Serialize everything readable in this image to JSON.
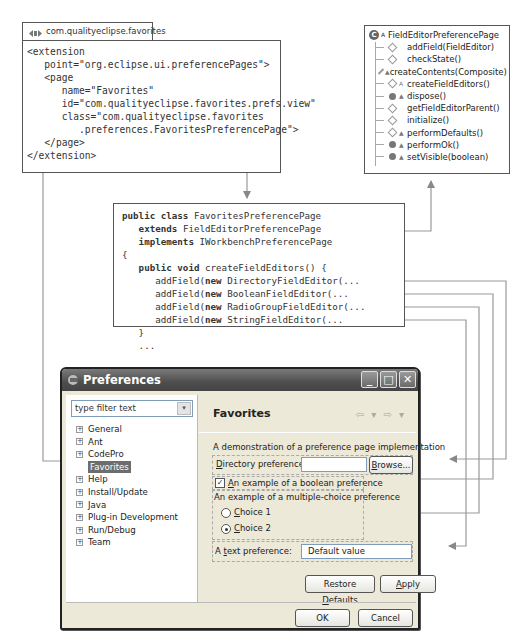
{
  "xml_panel": {
    "tab_label": "com.qualityeclipse.favorites",
    "lines": [
      "<extension",
      "   point=\"org.eclipse.ui.preferencePages\">",
      "   <page",
      "      name=\"Favorites\"",
      "      id=\"com.qualityeclipse.favorites.prefs.view\"",
      "      class=\"com.qualityeclipse.favorites",
      "         .preferences.FavoritesPreferencePage\">",
      "   </page>",
      "</extension>"
    ]
  },
  "java_panel": {
    "lines": [
      {
        "kw": "public class",
        "rest": " FavoritesPreferencePage",
        "indent": ""
      },
      {
        "kw": "extends",
        "rest": " FieldEditorPreferencePage",
        "indent": "   "
      },
      {
        "kw": "implements",
        "rest": " IWorkbenchPreferencePage",
        "indent": "   "
      },
      {
        "kw": "",
        "rest": "{",
        "indent": ""
      },
      {
        "kw": "public void",
        "rest": " createFieldEditors() {",
        "indent": "   "
      },
      {
        "kw": "new",
        "pre": "addField(",
        "rest": " DirectoryFieldEditor(...",
        "indent": "      "
      },
      {
        "kw": "new",
        "pre": "addField(",
        "rest": " BooleanFieldEditor(...",
        "indent": "      "
      },
      {
        "kw": "new",
        "pre": "addField(",
        "rest": " RadioGroupFieldEditor(...",
        "indent": "      "
      },
      {
        "kw": "new",
        "pre": "addField(",
        "rest": " StringFieldEditor(...",
        "indent": "      "
      },
      {
        "kw": "",
        "rest": "}",
        "indent": "   "
      },
      {
        "kw": "",
        "rest": "...",
        "indent": "   "
      }
    ]
  },
  "outline_panel": {
    "class_name": "FieldEditorPreferencePage",
    "class_icon": "abstract-class-icon",
    "methods": [
      {
        "name": "addField(FieldEditor)",
        "icon": "protected-method-icon",
        "decor": ""
      },
      {
        "name": "checkState()",
        "icon": "protected-method-icon",
        "decor": ""
      },
      {
        "name": "createContents(Composite)",
        "icon": "protected-method-icon",
        "decor": "▲"
      },
      {
        "name": "createFieldEditors()",
        "icon": "protected-method-icon",
        "decor": "A"
      },
      {
        "name": "dispose()",
        "icon": "public-method-icon",
        "decor": "▲"
      },
      {
        "name": "getFieldEditorParent()",
        "icon": "protected-method-icon",
        "decor": ""
      },
      {
        "name": "initialize()",
        "icon": "protected-method-icon",
        "decor": ""
      },
      {
        "name": "performDefaults()",
        "icon": "protected-method-icon",
        "decor": "▲"
      },
      {
        "name": "performOk()",
        "icon": "public-method-icon",
        "decor": "▲"
      },
      {
        "name": "setVisible(boolean)",
        "icon": "public-method-icon",
        "decor": "▲"
      }
    ]
  },
  "dialog": {
    "title": "Preferences",
    "window_buttons": {
      "minimize": "_",
      "maximize": "□",
      "close": "✕"
    },
    "filter": {
      "placeholder": "type filter text",
      "dropdown": "▾"
    },
    "tree": [
      {
        "label": "General",
        "expander": "+",
        "child": false,
        "selected": false
      },
      {
        "label": "Ant",
        "expander": "+",
        "child": false,
        "selected": false
      },
      {
        "label": "CodePro",
        "expander": "+",
        "child": false,
        "selected": false
      },
      {
        "label": "Favorites",
        "expander": "",
        "child": true,
        "selected": true
      },
      {
        "label": "Help",
        "expander": "+",
        "child": false,
        "selected": false
      },
      {
        "label": "Install/Update",
        "expander": "+",
        "child": false,
        "selected": false
      },
      {
        "label": "Java",
        "expander": "+",
        "child": false,
        "selected": false
      },
      {
        "label": "Plug-in Development",
        "expander": "+",
        "child": false,
        "selected": false
      },
      {
        "label": "Run/Debug",
        "expander": "+",
        "child": false,
        "selected": false
      },
      {
        "label": "Team",
        "expander": "+",
        "child": false,
        "selected": false
      }
    ],
    "page": {
      "title": "Favorites",
      "nav": {
        "back": "⇦ ▾",
        "forward": "⇨ ▾"
      },
      "description": "A demonstration of a preference page implementation",
      "directory": {
        "label_u": "D",
        "label_rest": "irectory preference:",
        "value": "",
        "browse_u": "B",
        "browse_rest": "rowse..."
      },
      "boolean": {
        "checked": "✓",
        "label_u": "A",
        "label_rest": "n example of a boolean preference"
      },
      "radio": {
        "group_label": "An example of a multiple-choice preference",
        "choices": [
          {
            "u": "C",
            "rest": "hoice 1",
            "selected": false
          },
          {
            "u": "C",
            "rest": "hoice 2",
            "selected": true
          }
        ]
      },
      "text": {
        "label_pre": "A ",
        "label_u": "t",
        "label_rest": "ext preference:",
        "value": "Default value"
      },
      "restore_pre": "Restore ",
      "restore_u": "D",
      "restore_rest": "efaults",
      "apply_u": "A",
      "apply_rest": "pply"
    },
    "ok_label": "OK",
    "cancel_label": "Cancel"
  }
}
